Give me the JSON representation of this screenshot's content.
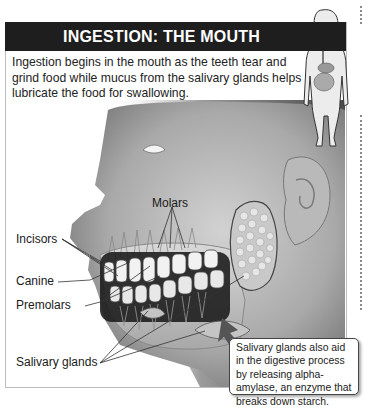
{
  "header": {
    "title": "INGESTION: THE MOUTH"
  },
  "intro": {
    "text": "Ingestion begins in the mouth as the teeth tear and grind food while mucus from the salivary glands helps lubricate the food for swallowing."
  },
  "labels": {
    "molars": "Molars",
    "incisors": "Incisors",
    "canine": "Canine",
    "premolars": "Premolars",
    "salivary_glands": "Salivary glands"
  },
  "callout": {
    "text": "Salivary glands also aid in the digestive process by releasing alpha-amylase, an enzyme that breaks down starch."
  },
  "colors": {
    "header_bg": "#1e1e1e",
    "header_text": "#ffffff",
    "callout_arrow": "#555555"
  }
}
